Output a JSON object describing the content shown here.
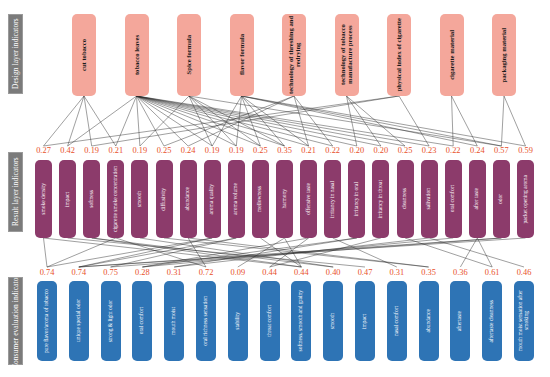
{
  "diagram": {
    "type": "hierarchical-indicator-map",
    "layers": [
      {
        "id": "design",
        "tag": "Design layer indicators",
        "tag_color": "#7b7b7b",
        "node_color": "#f4a79b",
        "nodes": [
          {
            "label": "cut tobacco"
          },
          {
            "label": "tobacco leaves"
          },
          {
            "label": "Spice formula"
          },
          {
            "label": "flavor formula"
          },
          {
            "label": "technology of threshing and redrying"
          },
          {
            "label": "technology of tobacco manufacture process"
          },
          {
            "label": "physical index of cigarette"
          },
          {
            "label": "cigarette material"
          },
          {
            "label": "packaging material"
          }
        ]
      },
      {
        "id": "result",
        "tag": "Result layer indicators",
        "tag_color": "#7b7b7b",
        "node_color": "#8c3b6b",
        "weight_color": "#e8502a",
        "nodes": [
          {
            "label": "smoke density",
            "weight": "0.27"
          },
          {
            "label": "impact",
            "weight": "0.42"
          },
          {
            "label": "softness",
            "weight": "0.19"
          },
          {
            "label": "cigarette smoke concentration",
            "weight": "0.21"
          },
          {
            "label": "smooth",
            "weight": "0.19"
          },
          {
            "label": "diffusivity",
            "weight": "0.25"
          },
          {
            "label": "abundance",
            "weight": "0.24"
          },
          {
            "label": "aroma quality",
            "weight": "0.19"
          },
          {
            "label": "aroma volume",
            "weight": "0.19"
          },
          {
            "label": "mellowness",
            "weight": "0.25"
          },
          {
            "label": "harmony",
            "weight": "0.35"
          },
          {
            "label": "offensive taste",
            "weight": "0.21"
          },
          {
            "label": "irritancy in nasal",
            "weight": "0.22"
          },
          {
            "label": "irritancy in oral",
            "weight": "0.20"
          },
          {
            "label": "irritancy in throat",
            "weight": "0.20"
          },
          {
            "label": "cleanness",
            "weight": "0.25"
          },
          {
            "label": "salivation",
            "weight": "0.23"
          },
          {
            "label": "oral comfort",
            "weight": "0.22"
          },
          {
            "label": "after taste",
            "weight": "0.24"
          },
          {
            "label": "odor",
            "weight": "0.57"
          },
          {
            "label": "packet opening aroma",
            "weight": "0.59"
          }
        ]
      },
      {
        "id": "consumer",
        "tag": "Consumer evaluation indicators",
        "tag_color": "#7b7b7b",
        "node_color": "#2e74b5",
        "weight_color": "#e8502a",
        "nodes": [
          {
            "label": "pure flavor/aroma of tobacco",
            "weight": "0.74"
          },
          {
            "label": "unique special odor",
            "weight": "0.74"
          },
          {
            "label": "strong & light odor",
            "weight": "0.75"
          },
          {
            "label": "oral comfort",
            "weight": "0.28"
          },
          {
            "label": "mouth moist",
            "weight": "0.31"
          },
          {
            "label": "oral richness sensation",
            "weight": "0.72"
          },
          {
            "label": "stability",
            "weight": "0.09"
          },
          {
            "label": "throat comfort",
            "weight": "0.44"
          },
          {
            "label": "softness, smooth and grainy",
            "weight": "0.44"
          },
          {
            "label": "smooth",
            "weight": "0.40"
          },
          {
            "label": "impact",
            "weight": "0.47"
          },
          {
            "label": "nasal comfort",
            "weight": "0.31"
          },
          {
            "label": "abundance",
            "weight": "0.35"
          },
          {
            "label": "aftertaste",
            "weight": "0.36"
          },
          {
            "label": "aftertaste cleanness",
            "weight": "0.61"
          },
          {
            "label": "mouth moist sensation after smoking",
            "weight": "0.46"
          }
        ]
      }
    ]
  }
}
